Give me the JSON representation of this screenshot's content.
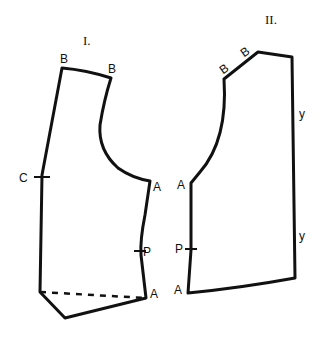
{
  "diagram": {
    "type": "sewing-pattern",
    "stroke_color": "#111111",
    "background": "#ffffff",
    "pieces": [
      {
        "id": "piece-1",
        "title": "I.",
        "labels": {
          "shoulder_left": "B",
          "shoulder_right": "B",
          "side_mark": "C",
          "armhole_point": "A",
          "mid_point": "P",
          "hem_point": "A"
        },
        "has_dashed_line": true
      },
      {
        "id": "piece-2",
        "title": "II.",
        "labels": {
          "shoulder_left": "B",
          "shoulder_right": "B",
          "armhole_point": "A",
          "mid_point": "P",
          "hem_point": "A",
          "edge_mark_top": "y",
          "edge_mark_bottom": "y"
        },
        "has_dashed_line": false
      }
    ]
  }
}
